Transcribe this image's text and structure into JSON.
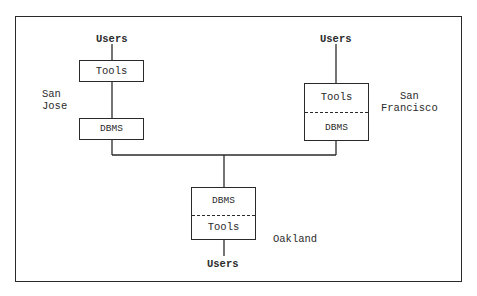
{
  "diagram": {
    "sites": {
      "san_jose": {
        "label": "San\nJose",
        "users": "Users",
        "top_box": "Tools",
        "bottom_box": "DBMS"
      },
      "san_francisco": {
        "label": "San\nFrancisco",
        "users": "Users",
        "box_top": "Tools",
        "box_bottom": "DBMS"
      },
      "oakland": {
        "label": "Oakland",
        "users": "Users",
        "box_top": "DBMS",
        "box_bottom": "Tools"
      }
    },
    "colors": {
      "line": "#2a2a2a",
      "text": "#2b2b2b",
      "background": "#ffffff"
    }
  }
}
